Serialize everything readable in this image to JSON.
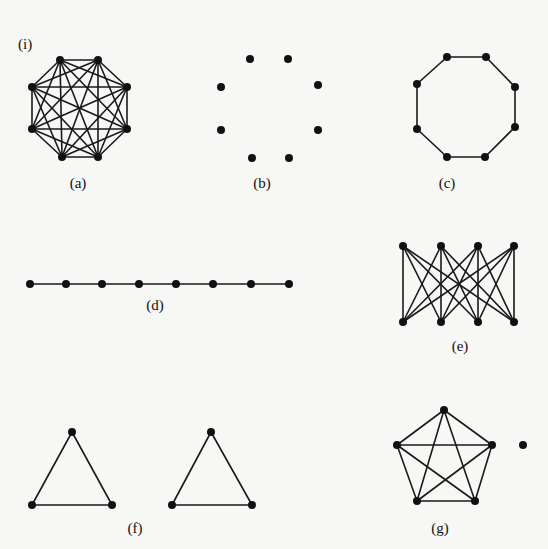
{
  "figure": {
    "panel_marker": {
      "text": "(i)",
      "x": 18,
      "y": 49
    },
    "vertex_radius": 4,
    "graphs": [
      {
        "id": "a",
        "label": "(a)",
        "label_pos": [
          78,
          188
        ],
        "description": "complete graph K8",
        "vertices": [
          [
            60,
            60
          ],
          [
            98,
            60
          ],
          [
            127,
            87
          ],
          [
            127,
            129
          ],
          [
            98,
            157
          ],
          [
            62,
            157
          ],
          [
            32,
            129
          ],
          [
            32,
            87
          ]
        ],
        "edges": "complete"
      },
      {
        "id": "b",
        "label": "(b)",
        "label_pos": [
          262,
          188
        ],
        "description": "empty graph on 8 vertices",
        "vertices": [
          [
            250,
            59
          ],
          [
            288,
            59
          ],
          [
            318,
            85
          ],
          [
            318,
            130
          ],
          [
            289,
            158
          ],
          [
            252,
            158
          ],
          [
            221,
            130
          ],
          [
            221,
            87
          ]
        ],
        "edges": []
      },
      {
        "id": "c",
        "label": "(c)",
        "label_pos": [
          447,
          188
        ],
        "description": "cycle C8",
        "vertices": [
          [
            447,
            57
          ],
          [
            486,
            57
          ],
          [
            515,
            87
          ],
          [
            515,
            127
          ],
          [
            485,
            157
          ],
          [
            447,
            157
          ],
          [
            417,
            129
          ],
          [
            417,
            84
          ]
        ],
        "edges": [
          [
            0,
            1
          ],
          [
            1,
            2
          ],
          [
            2,
            3
          ],
          [
            3,
            4
          ],
          [
            4,
            5
          ],
          [
            5,
            6
          ],
          [
            6,
            7
          ],
          [
            7,
            0
          ]
        ]
      },
      {
        "id": "d",
        "label": "(d)",
        "label_pos": [
          155,
          310
        ],
        "description": "path P8",
        "vertices": [
          [
            30,
            284
          ],
          [
            66,
            284
          ],
          [
            102,
            284
          ],
          [
            139,
            284
          ],
          [
            176,
            284
          ],
          [
            213,
            284
          ],
          [
            251,
            284
          ],
          [
            289,
            284
          ]
        ],
        "edges": [
          [
            0,
            1
          ],
          [
            1,
            2
          ],
          [
            2,
            3
          ],
          [
            3,
            4
          ],
          [
            4,
            5
          ],
          [
            5,
            6
          ],
          [
            6,
            7
          ]
        ]
      },
      {
        "id": "e",
        "label": "(e)",
        "label_pos": [
          460,
          351
        ],
        "description": "complete bipartite graph K4,4",
        "vertices": [
          [
            403,
            246
          ],
          [
            441,
            246
          ],
          [
            478,
            246
          ],
          [
            514,
            246
          ],
          [
            403,
            322
          ],
          [
            441,
            322
          ],
          [
            478,
            322
          ],
          [
            514,
            322
          ]
        ],
        "edges": "bipartite_4_4"
      },
      {
        "id": "f",
        "label": "(f)",
        "label_pos": [
          135,
          533
        ],
        "description": "two disjoint triangles",
        "vertices": [
          [
            72,
            432
          ],
          [
            32,
            505
          ],
          [
            112,
            505
          ],
          [
            211,
            432
          ],
          [
            172,
            505
          ],
          [
            252,
            505
          ]
        ],
        "edges": [
          [
            0,
            1
          ],
          [
            1,
            2
          ],
          [
            2,
            0
          ],
          [
            3,
            4
          ],
          [
            4,
            5
          ],
          [
            5,
            3
          ]
        ]
      },
      {
        "id": "g",
        "label": "(g)",
        "label_pos": [
          440,
          533
        ],
        "description": "K5 plus an isolated vertex",
        "vertices": [
          [
            444,
            410
          ],
          [
            492,
            445
          ],
          [
            475,
            501
          ],
          [
            417,
            501
          ],
          [
            397,
            445
          ],
          [
            523,
            445
          ]
        ],
        "edges": [
          [
            0,
            1
          ],
          [
            0,
            2
          ],
          [
            0,
            3
          ],
          [
            0,
            4
          ],
          [
            1,
            2
          ],
          [
            1,
            3
          ],
          [
            1,
            4
          ],
          [
            2,
            3
          ],
          [
            2,
            4
          ],
          [
            3,
            4
          ]
        ]
      }
    ]
  }
}
